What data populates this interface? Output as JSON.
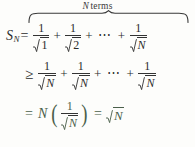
{
  "document": {
    "type": "math-derivation",
    "background_color": "#fdfdfb",
    "text_color": "#2b2b2b",
    "line3_color": "#4a5f4a"
  },
  "brace": {
    "label_italic": "N",
    "label_text": "terms"
  },
  "equation": {
    "line1": {
      "lhs_symbol": "S",
      "lhs_subscript": "N",
      "relation": "=",
      "term1_numerator": "1",
      "term1_radicand": "1",
      "plus1": "+",
      "term2_numerator": "1",
      "term2_radicand": "2",
      "plus2": "+",
      "ellipsis": "⋯",
      "plus3": "+",
      "term3_numerator": "1",
      "term3_radicand": "N"
    },
    "line2": {
      "relation": "≥",
      "term1_numerator": "1",
      "term1_radicand": "N",
      "plus1": "+",
      "term2_numerator": "1",
      "term2_radicand": "N",
      "plus2": "+",
      "ellipsis": "⋯",
      "plus3": "+",
      "term3_numerator": "1",
      "term3_radicand": "N"
    },
    "line3": {
      "relation": "=",
      "factor": "N",
      "paren_open": "(",
      "numerator": "1",
      "radicand": "N",
      "paren_close": ")",
      "relation2": "=",
      "result_radicand": "N"
    }
  }
}
